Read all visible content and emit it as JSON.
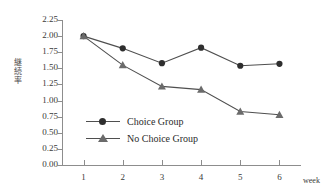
{
  "chart_data": {
    "type": "line",
    "title": "",
    "xlabel": "week",
    "ylabel": "継続率",
    "x": [
      1,
      2,
      3,
      4,
      5,
      6
    ],
    "xtick_labels": [
      "1",
      "2",
      "3",
      "4",
      "5",
      "6"
    ],
    "ytick_labels": [
      "0.00",
      "0.25",
      "0.50",
      "0.75",
      "1.00",
      "1.25",
      "1.50",
      "1.75",
      "2.00",
      "2.25"
    ],
    "ytick_values": [
      0.0,
      0.25,
      0.5,
      0.75,
      1.0,
      1.25,
      1.5,
      1.75,
      2.0,
      2.25
    ],
    "ylim": [
      0.0,
      2.25
    ],
    "xlim": [
      0.45,
      6.55
    ],
    "grid": false,
    "legend_position": "center",
    "series": [
      {
        "name": "Choice Group",
        "marker": "circle",
        "color": "#2e2e2e",
        "values": [
          2.0,
          1.81,
          1.58,
          1.82,
          1.54,
          1.57
        ]
      },
      {
        "name": "No Choice Group",
        "marker": "triangle",
        "color": "#6b6b6b",
        "values": [
          2.0,
          1.55,
          1.22,
          1.17,
          0.83,
          0.78
        ]
      }
    ]
  },
  "axis": {
    "y_label_chars": [
      "継",
      "続",
      "率"
    ],
    "x_axis_name": "week"
  },
  "legend": {
    "items": [
      {
        "label": "Choice Group",
        "marker": "circle-marker-icon"
      },
      {
        "label": "No Choice Group",
        "marker": "triangle-marker-icon"
      }
    ]
  },
  "colors": {
    "line": "#4f4f4f",
    "axis": "#8d8d8d",
    "text": "#2b2b2b",
    "background": "#ffffff"
  }
}
